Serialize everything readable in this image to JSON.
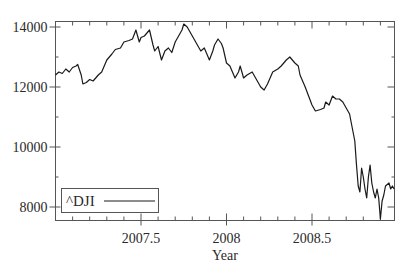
{
  "chart_data": {
    "type": "line",
    "title": "",
    "xlabel": "Year",
    "ylabel": "",
    "xlim": [
      2007.0,
      2008.98
    ],
    "ylim": [
      7600,
      14150
    ],
    "x_ticks": [
      2007.5,
      2008,
      2008.5
    ],
    "x_tick_labels": [
      "2007.5",
      "2008",
      "2008.5"
    ],
    "y_ticks": [
      8000,
      10000,
      12000,
      14000
    ],
    "y_tick_labels": [
      "8000",
      "10000",
      "12000",
      "14000"
    ],
    "grid": false,
    "legend": {
      "position": "lower left",
      "entries": [
        "^DJI"
      ]
    },
    "series": [
      {
        "name": "^DJI",
        "color": "#1a1a1a",
        "x": [
          2007.0,
          2007.02,
          2007.04,
          2007.06,
          2007.08,
          2007.1,
          2007.12,
          2007.13,
          2007.15,
          2007.16,
          2007.18,
          2007.2,
          2007.22,
          2007.25,
          2007.27,
          2007.3,
          2007.33,
          2007.35,
          2007.38,
          2007.4,
          2007.43,
          2007.45,
          2007.47,
          2007.49,
          2007.5,
          2007.52,
          2007.55,
          2007.57,
          2007.58,
          2007.6,
          2007.62,
          2007.64,
          2007.66,
          2007.68,
          2007.7,
          2007.72,
          2007.74,
          2007.75,
          2007.77,
          2007.8,
          2007.82,
          2007.85,
          2007.87,
          2007.9,
          2007.92,
          2007.93,
          2007.95,
          2007.97,
          2007.98,
          2008.0,
          2008.02,
          2008.05,
          2008.07,
          2008.08,
          2008.1,
          2008.12,
          2008.15,
          2008.17,
          2008.2,
          2008.22,
          2008.24,
          2008.27,
          2008.3,
          2008.32,
          2008.35,
          2008.37,
          2008.4,
          2008.42,
          2008.43,
          2008.46,
          2008.48,
          2008.5,
          2008.52,
          2008.55,
          2008.57,
          2008.58,
          2008.6,
          2008.62,
          2008.64,
          2008.66,
          2008.68,
          2008.7,
          2008.72,
          2008.73,
          2008.75,
          2008.76,
          2008.77,
          2008.78,
          2008.79,
          2008.8,
          2008.81,
          2008.82,
          2008.83,
          2008.84,
          2008.85,
          2008.86,
          2008.87,
          2008.88,
          2008.89,
          2008.9,
          2008.91,
          2008.92,
          2008.93,
          2008.95,
          2008.96,
          2008.97,
          2008.98
        ],
        "values": [
          12400,
          12500,
          12450,
          12600,
          12500,
          12650,
          12700,
          12750,
          12400,
          12100,
          12150,
          12250,
          12200,
          12400,
          12500,
          12900,
          13100,
          13250,
          13300,
          13500,
          13550,
          13600,
          13900,
          13500,
          13650,
          13700,
          13900,
          13400,
          13200,
          13350,
          12900,
          13200,
          13300,
          13150,
          13500,
          13700,
          13900,
          14100,
          14000,
          13700,
          13500,
          13200,
          13300,
          12900,
          13200,
          13400,
          13600,
          13450,
          13300,
          12800,
          12700,
          12300,
          12500,
          12700,
          12300,
          12400,
          12500,
          12300,
          12000,
          11900,
          12100,
          12500,
          12600,
          12700,
          12900,
          13000,
          12800,
          12700,
          12400,
          12000,
          11700,
          11400,
          11200,
          11250,
          11300,
          11500,
          11400,
          11700,
          11600,
          11600,
          11500,
          11300,
          11100,
          10800,
          10200,
          9400,
          8700,
          8500,
          9300,
          9000,
          8600,
          8300,
          9000,
          9400,
          8800,
          8500,
          8300,
          8600,
          8300,
          7600,
          8200,
          8400,
          8700,
          8800,
          8600,
          8700,
          8600
        ]
      }
    ]
  },
  "legend": {
    "label": "^DJI"
  },
  "axis": {
    "xlabel": "Year"
  }
}
